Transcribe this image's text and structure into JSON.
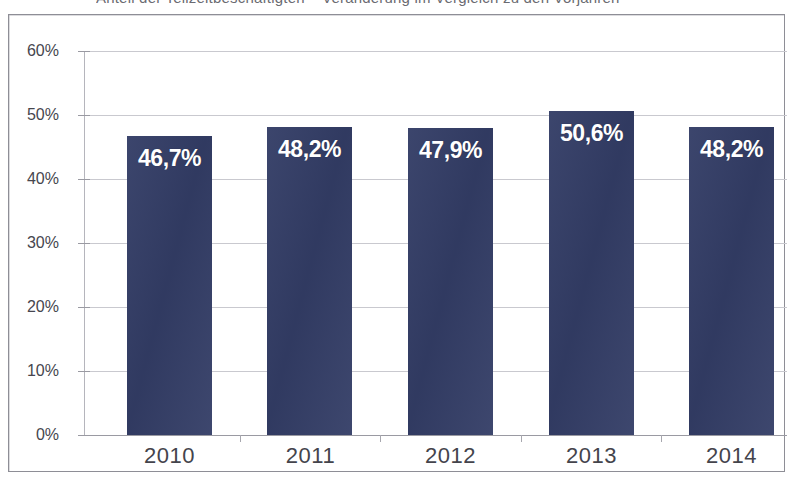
{
  "title": {
    "text": "Anteil der Teilzeitbeschäftigten – Veränderung im Vergleich zu den Vorjahren",
    "note": "cut off at top edge of scan"
  },
  "colors": {
    "bar": "#333d66",
    "bar_label": "#ffffff",
    "gridline": "#c9c9cf",
    "axis": "#9a9aa2",
    "tick_text": "#46464e",
    "frame": "#8e8e96",
    "background": "#ffffff"
  },
  "chart_data": {
    "type": "bar",
    "title": "Anteil der Teilzeitbeschäftigten – Veränderung im Vergleich zu den Vorjahren",
    "subtitle": "",
    "xlabel": "",
    "ylabel": "",
    "categories": [
      "2010",
      "2011",
      "2012",
      "2013",
      "2014"
    ],
    "values": [
      46.7,
      48.2,
      47.9,
      50.6,
      48.2
    ],
    "data_labels": [
      "46,7%",
      "48,2%",
      "47,9%",
      "50,6%",
      "48,2%"
    ],
    "ylim": [
      0,
      60
    ],
    "ytick_values": [
      0,
      10,
      20,
      30,
      40,
      50,
      60
    ],
    "ytick_labels": [
      "0%",
      "10%",
      "20%",
      "30%",
      "40%",
      "50%",
      "60%"
    ],
    "grid": true,
    "grid_axis": "y",
    "legend": false,
    "legend_position": "none",
    "value_unit": "%",
    "decimal_separator": ",",
    "series": [
      {
        "name": "Anteil",
        "values": [
          46.7,
          48.2,
          47.9,
          50.6,
          48.2
        ]
      }
    ]
  }
}
